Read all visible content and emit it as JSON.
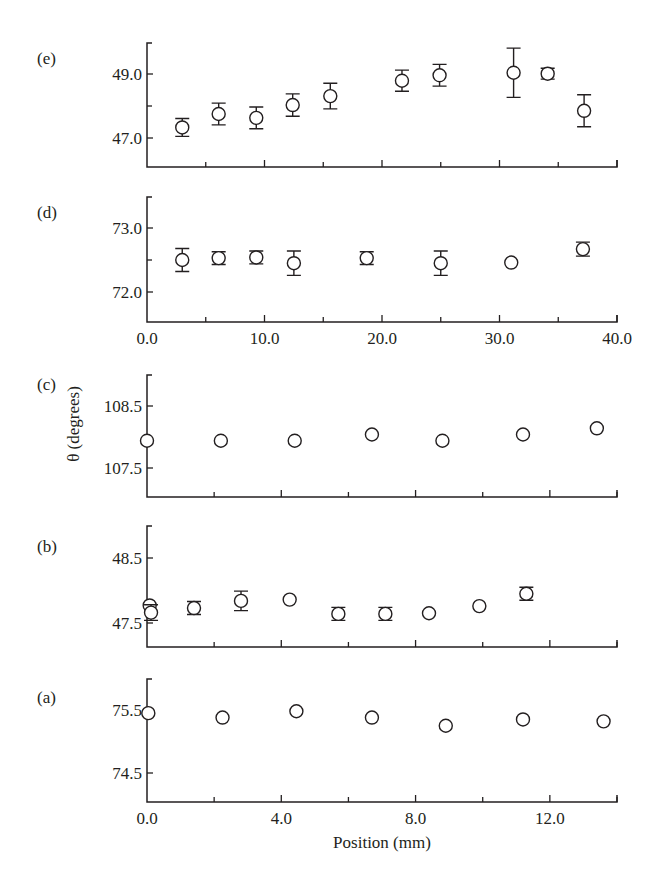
{
  "figure": {
    "y_axis_title": "θ (degrees)",
    "bottom_x_axis_title": "Position (mm)",
    "ink_color": "#231f20",
    "background": "#ffffff"
  },
  "chart_data": [
    {
      "panel": "(e)",
      "type": "scatter",
      "title": "",
      "xlabel": "",
      "ylabel": "θ (degrees)",
      "xlim": [
        0,
        40
      ],
      "ylim": [
        46.0,
        50.0
      ],
      "x_major_ticks": [
        0,
        10,
        20,
        30,
        40
      ],
      "x_minor_ticks": [
        5,
        15,
        25,
        35
      ],
      "x_tick_labels_shown": false,
      "y_major_ticks": [
        47.0,
        49.0
      ],
      "y_tick_labels": [
        "47.0",
        "49.0"
      ],
      "y_minor_ticks": [
        48.0
      ],
      "grid": false,
      "error_bars": true,
      "x": [
        3.0,
        6.1,
        9.3,
        12.4,
        15.6,
        21.7,
        24.9,
        31.2,
        34.1,
        37.2
      ],
      "y": [
        47.33,
        47.75,
        47.63,
        48.03,
        48.31,
        48.79,
        48.96,
        49.04,
        49.01,
        47.85
      ],
      "yerr": [
        0.28,
        0.34,
        0.34,
        0.35,
        0.4,
        0.33,
        0.34,
        0.77,
        0.17,
        0.5
      ]
    },
    {
      "panel": "(d)",
      "type": "scatter",
      "title": "",
      "xlabel": "",
      "ylabel": "θ (degrees)",
      "xlim": [
        0,
        40
      ],
      "ylim": [
        71.5,
        73.5
      ],
      "x_major_ticks": [
        0,
        10,
        20,
        30,
        40
      ],
      "x_tick_labels": [
        "0.0",
        "10.0",
        "20.0",
        "30.0",
        "40.0"
      ],
      "x_minor_ticks": [
        5,
        15,
        25,
        35
      ],
      "x_tick_labels_shown": true,
      "y_major_ticks": [
        72.0,
        73.0
      ],
      "y_tick_labels": [
        "72.0",
        "73.0"
      ],
      "y_minor_ticks": [
        72.5
      ],
      "grid": false,
      "error_bars": true,
      "x": [
        3.0,
        6.1,
        9.3,
        12.5,
        18.7,
        25.0,
        31.0,
        37.1
      ],
      "y": [
        72.5,
        72.53,
        72.54,
        72.45,
        72.53,
        72.45,
        72.46,
        72.67
      ],
      "yerr": [
        0.18,
        0.1,
        0.1,
        0.19,
        0.1,
        0.19,
        0,
        0.11
      ]
    },
    {
      "panel": "(c)",
      "type": "scatter",
      "title": "",
      "xlabel": "",
      "ylabel": "θ (degrees)",
      "xlim": [
        0,
        14
      ],
      "ylim": [
        107.0,
        109.0
      ],
      "x_major_ticks": [
        0,
        4,
        8,
        12
      ],
      "x_minor_ticks": [
        2,
        6,
        10,
        14
      ],
      "x_tick_labels_shown": false,
      "y_major_ticks": [
        107.5,
        108.5
      ],
      "y_tick_labels": [
        "107.5",
        "108.5"
      ],
      "y_minor_ticks": [],
      "grid": false,
      "error_bars": false,
      "x": [
        0.0,
        2.2,
        4.4,
        6.7,
        8.8,
        11.2,
        13.4
      ],
      "y": [
        107.94,
        107.94,
        107.94,
        108.04,
        107.94,
        108.04,
        108.14
      ],
      "yerr": [
        0,
        0,
        0,
        0,
        0,
        0,
        0
      ]
    },
    {
      "panel": "(b)",
      "type": "scatter",
      "title": "",
      "xlabel": "",
      "ylabel": "θ (degrees)",
      "xlim": [
        0,
        14
      ],
      "ylim": [
        47.1,
        48.9
      ],
      "x_major_ticks": [
        0,
        4,
        8,
        12
      ],
      "x_minor_ticks": [
        2,
        6,
        10,
        14
      ],
      "x_tick_labels_shown": false,
      "y_major_ticks": [
        47.5,
        48.5
      ],
      "y_tick_labels": [
        "47.5",
        "48.5"
      ],
      "y_minor_ticks": [],
      "grid": false,
      "error_bars": true,
      "x": [
        0.08,
        0.12,
        1.4,
        2.8,
        4.25,
        5.7,
        7.1,
        8.4,
        9.9,
        11.3
      ],
      "y": [
        47.77,
        47.66,
        47.73,
        47.84,
        47.86,
        47.64,
        47.64,
        47.65,
        47.76,
        47.95
      ],
      "yerr": [
        0,
        0.12,
        0.1,
        0.15,
        0,
        0.1,
        0.1,
        0,
        0,
        0.1
      ]
    },
    {
      "panel": "(a)",
      "type": "scatter",
      "title": "",
      "xlabel": "Position (mm)",
      "ylabel": "θ (degrees)",
      "xlim": [
        0,
        14
      ],
      "ylim": [
        74.0,
        76.0
      ],
      "x_major_ticks": [
        0,
        4,
        8,
        12
      ],
      "x_tick_labels": [
        "0.0",
        "4.0",
        "8.0",
        "12.0"
      ],
      "x_minor_ticks": [
        2,
        6,
        10,
        14
      ],
      "x_tick_labels_shown": true,
      "y_major_ticks": [
        74.5,
        75.5
      ],
      "y_tick_labels": [
        "74.5",
        "75.5"
      ],
      "y_minor_ticks": [],
      "grid": false,
      "error_bars": false,
      "x": [
        0.04,
        2.25,
        4.45,
        6.7,
        8.9,
        11.2,
        13.6
      ],
      "y": [
        75.45,
        75.38,
        75.48,
        75.38,
        75.25,
        75.35,
        75.32
      ],
      "yerr": [
        0,
        0,
        0,
        0,
        0,
        0,
        0
      ]
    }
  ],
  "layout": {
    "panels": [
      {
        "panel": "(e)",
        "top": 43,
        "bottom": 167,
        "y_ref": [
          [
            47.0,
            138
          ],
          [
            49.0,
            74
          ]
        ],
        "label_xy": [
          37,
          64
        ]
      },
      {
        "panel": "(d)",
        "top": 197,
        "bottom": 322,
        "y_ref": [
          [
            72.0,
            292
          ],
          [
            73.0,
            228
          ]
        ],
        "label_xy": [
          37,
          218
        ]
      },
      {
        "panel": "(c)",
        "top": 375,
        "bottom": 497,
        "y_ref": [
          [
            107.5,
            468
          ],
          [
            108.5,
            406
          ]
        ],
        "label_xy": [
          37,
          390
        ]
      },
      {
        "panel": "(b)",
        "top": 526,
        "bottom": 647,
        "y_ref": [
          [
            47.5,
            623
          ],
          [
            48.5,
            558
          ]
        ],
        "label_xy": [
          37,
          552
        ]
      },
      {
        "panel": "(a)",
        "top": 679,
        "bottom": 802,
        "y_ref": [
          [
            74.5,
            773
          ],
          [
            75.5,
            710
          ]
        ],
        "label_xy": [
          37,
          703
        ]
      }
    ],
    "x_left": 147,
    "x_right": 617
  }
}
